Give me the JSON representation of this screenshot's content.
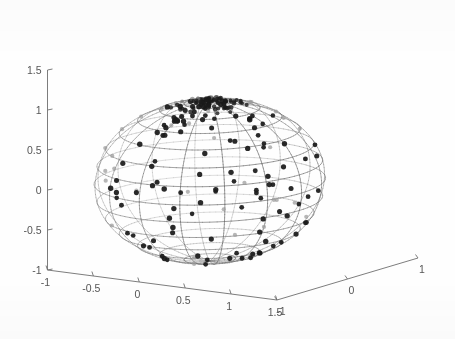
{
  "figure": {
    "background_color": "#ffffff",
    "axis_color": "#6e6e6e",
    "tick_label_color": "#555555",
    "mesh_color": "#707070",
    "point_front_color": "#1a1a1a",
    "point_back_color": "#9a9a9a"
  },
  "chart_data": {
    "type": "scatter",
    "title": "",
    "subtitle": "",
    "xlabel": "",
    "ylabel": "",
    "zlabel": "",
    "projection": "3d",
    "grid": true,
    "legend": null,
    "xlim": [
      -1,
      1.5
    ],
    "ylim": [
      -1,
      1
    ],
    "zlim": [
      -1,
      1.5
    ],
    "x_ticks": [
      "-1",
      "-0.5",
      "0",
      "0.5",
      "1",
      "1.5"
    ],
    "x_tick_values": [
      -1,
      -0.5,
      0,
      0.5,
      1,
      1.5
    ],
    "y_ticks": [
      "-1",
      "0",
      "1"
    ],
    "y_tick_values": [
      -1,
      0,
      1
    ],
    "z_ticks": [
      "-1",
      "-0.5",
      "0",
      "0.5",
      "1",
      "1.5"
    ],
    "z_tick_values": [
      -1,
      -0.5,
      0,
      0.5,
      1,
      1.5
    ],
    "surface": {
      "name": "unit-sphere-wireframe",
      "shape": "sphere",
      "radius": 1,
      "center": [
        0,
        0,
        0
      ],
      "meridians": 16,
      "parallels": 14,
      "style": "wireframe"
    },
    "series": [
      {
        "name": "points-front",
        "marker": "filled-circle",
        "color": "#1a1a1a",
        "size": 4.6,
        "count": 96,
        "description": "Dark filled markers lying on the visible (front/right) hemisphere of the unit sphere."
      },
      {
        "name": "points-back",
        "marker": "filled-circle",
        "color": "#9a9a9a",
        "size": 4.2,
        "count": 62,
        "description": "Lighter gray markers lying on the occluded (back/left) hemisphere, seen through the wireframe."
      },
      {
        "name": "pole-cluster",
        "marker": "filled-circle",
        "color": "#6b6b6b",
        "size": 3.8,
        "count": 70,
        "description": "Dense overlapping cluster of markers concentrated at the north pole of the sphere."
      }
    ]
  }
}
